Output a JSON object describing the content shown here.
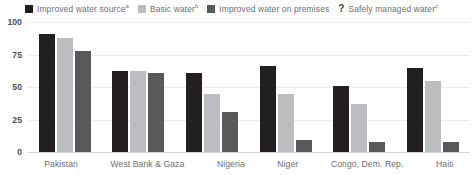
{
  "legend": {
    "items": [
      {
        "label": "Improved water source",
        "sup": "a",
        "color": "#231f20",
        "marker": "square",
        "name": "improved-water-source"
      },
      {
        "label": "Basic water",
        "sup": "b",
        "color": "#bcbdc0",
        "marker": "square",
        "name": "basic-water"
      },
      {
        "label": "Improved water on premises",
        "sup": "",
        "color": "#58595b",
        "marker": "square",
        "name": "improved-water-on-premises"
      },
      {
        "label": "Safely managed water",
        "sup": "c",
        "color": "#3f3f41",
        "marker": "question",
        "name": "safely-managed-water"
      }
    ]
  },
  "axes": {
    "y_ticks": [
      "100",
      "75",
      "50",
      "25",
      "0"
    ],
    "x_labels": [
      "Pakistan",
      "West Bank & Gaza",
      "Nigeria",
      "Niger",
      "Congo, Dem. Rep.",
      "Haiti"
    ]
  },
  "chart_data": {
    "type": "bar",
    "title": "",
    "xlabel": "",
    "ylabel": "",
    "ylim": [
      0,
      100
    ],
    "yticks": [
      0,
      25,
      50,
      75,
      100
    ],
    "grid": true,
    "legend_position": "top-center",
    "categories": [
      "Pakistan",
      "West Bank & Gaza",
      "Nigeria",
      "Niger",
      "Congo, Dem. Rep.",
      "Haiti"
    ],
    "series": [
      {
        "name": "Improved water source",
        "superscript": "a",
        "color": "#231f20",
        "values": [
          91,
          62,
          61,
          66,
          51,
          65
        ]
      },
      {
        "name": "Basic water",
        "superscript": "b",
        "color": "#bcbdc0",
        "values": [
          88,
          62,
          45,
          45,
          37,
          55
        ]
      },
      {
        "name": "Improved water on premises",
        "superscript": "",
        "color": "#58595b",
        "values": [
          78,
          61,
          31,
          9,
          8,
          8
        ]
      },
      {
        "name": "Safely managed water",
        "superscript": "c",
        "color": "#3f3f41",
        "values": [
          null,
          null,
          null,
          null,
          null,
          null
        ],
        "note": "no data plotted; indicated by question mark in legend"
      }
    ]
  }
}
